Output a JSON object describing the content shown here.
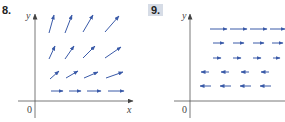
{
  "exercises": [
    {
      "number": "8.",
      "highlighted": false,
      "axis_labels": {
        "x": "x",
        "y": "y",
        "origin": "0"
      },
      "description": "Vector field: arrows grow longer and steeper with increasing y; horizontal along bottom row",
      "arrows": [
        {
          "x": 51,
          "y": 91,
          "dx": 12,
          "dy": 0
        },
        {
          "x": 69,
          "y": 91,
          "dx": 12,
          "dy": 0
        },
        {
          "x": 87,
          "y": 91,
          "dx": 14,
          "dy": 0
        },
        {
          "x": 108,
          "y": 91,
          "dx": 16,
          "dy": 0
        },
        {
          "x": 50,
          "y": 79,
          "dx": 9,
          "dy": -8
        },
        {
          "x": 66,
          "y": 78,
          "dx": 12,
          "dy": -7
        },
        {
          "x": 84,
          "y": 78,
          "dx": 14,
          "dy": -6
        },
        {
          "x": 106,
          "y": 78,
          "dx": 17,
          "dy": -6
        },
        {
          "x": 49,
          "y": 59,
          "dx": 6,
          "dy": -13
        },
        {
          "x": 65,
          "y": 59,
          "dx": 9,
          "dy": -13
        },
        {
          "x": 83,
          "y": 58,
          "dx": 12,
          "dy": -12
        },
        {
          "x": 105,
          "y": 58,
          "dx": 16,
          "dy": -11
        },
        {
          "x": 49,
          "y": 33,
          "dx": 5,
          "dy": -18
        },
        {
          "x": 65,
          "y": 33,
          "dx": 7,
          "dy": -18
        },
        {
          "x": 83,
          "y": 32,
          "dx": 10,
          "dy": -17
        },
        {
          "x": 105,
          "y": 32,
          "dx": 14,
          "dy": -16
        }
      ],
      "color": "#3a5aa8"
    },
    {
      "number": "9.",
      "highlighted": true,
      "axis_labels": {
        "y": "y",
        "origin": "0"
      },
      "description": "Vector field: arrows point right above a midline, left below it; length grows with distance from midline",
      "arrows": [
        {
          "x": 210,
          "y": 29,
          "dx": 17,
          "dy": 0
        },
        {
          "x": 230,
          "y": 29,
          "dx": 17,
          "dy": 0
        },
        {
          "x": 250,
          "y": 29,
          "dx": 17,
          "dy": 0
        },
        {
          "x": 270,
          "y": 29,
          "dx": 15,
          "dy": 0
        },
        {
          "x": 213,
          "y": 43,
          "dx": 11,
          "dy": 0
        },
        {
          "x": 233,
          "y": 43,
          "dx": 11,
          "dy": 0
        },
        {
          "x": 253,
          "y": 43,
          "dx": 11,
          "dy": 0
        },
        {
          "x": 272,
          "y": 43,
          "dx": 11,
          "dy": 0
        },
        {
          "x": 213,
          "y": 58,
          "dx": 8,
          "dy": 0
        },
        {
          "x": 233,
          "y": 58,
          "dx": 8,
          "dy": 0
        },
        {
          "x": 253,
          "y": 58,
          "dx": 8,
          "dy": 0
        },
        {
          "x": 273,
          "y": 58,
          "dx": 7,
          "dy": 0
        },
        {
          "x": 209,
          "y": 72,
          "dx": -8,
          "dy": 0
        },
        {
          "x": 229,
          "y": 72,
          "dx": -8,
          "dy": 0
        },
        {
          "x": 249,
          "y": 72,
          "dx": -8,
          "dy": 0
        },
        {
          "x": 269,
          "y": 72,
          "dx": -8,
          "dy": 0
        },
        {
          "x": 211,
          "y": 86,
          "dx": -11,
          "dy": 0
        },
        {
          "x": 231,
          "y": 86,
          "dx": -11,
          "dy": 0
        },
        {
          "x": 251,
          "y": 86,
          "dx": -11,
          "dy": 0
        },
        {
          "x": 271,
          "y": 86,
          "dx": -11,
          "dy": 0
        }
      ],
      "color": "#3a5aa8"
    }
  ]
}
